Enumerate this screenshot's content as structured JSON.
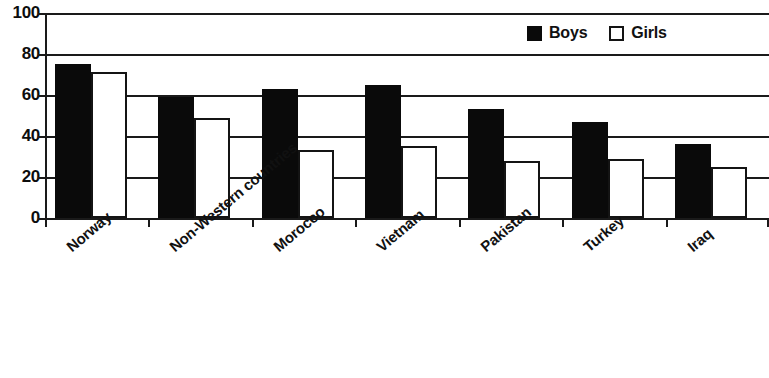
{
  "chart_data": {
    "type": "bar",
    "title": "",
    "subtitle": "",
    "xlabel": "",
    "ylabel": "",
    "ylim": [
      0,
      100
    ],
    "yticks": [
      0,
      20,
      40,
      60,
      80,
      100
    ],
    "ytick_labels": [
      "0",
      "20",
      "40",
      "60",
      "80",
      "100"
    ],
    "grid": true,
    "legend_position": "top-right",
    "categories": [
      "Norway",
      "Non-Western countries",
      "Morocco",
      "Vietnam",
      "Pakistan",
      "Turkey",
      "Iraq"
    ],
    "series": [
      {
        "name": "Boys",
        "color": "#0a0a0a",
        "values": [
          75,
          59,
          63,
          65,
          53,
          47,
          36
        ]
      },
      {
        "name": "Girls",
        "color": "#ffffff",
        "values": [
          71,
          49,
          33,
          35,
          28,
          29,
          25
        ]
      }
    ]
  },
  "legend": {
    "items": [
      {
        "label": "Boys",
        "swatch": "filled-square-icon"
      },
      {
        "label": "Girls",
        "swatch": "outlined-square-icon"
      }
    ]
  }
}
